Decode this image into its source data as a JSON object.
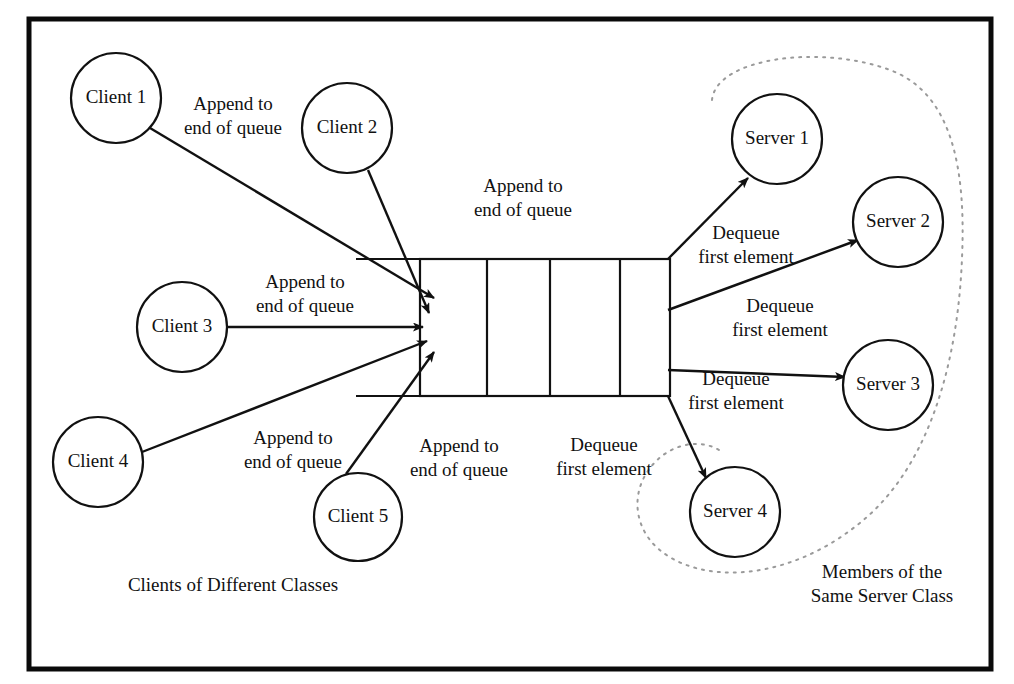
{
  "figure": {
    "background_color": "#ffffff",
    "ink_color": "#111111",
    "enclosure_color": "#9a9a9a",
    "frame_color": "#0a0a0a"
  },
  "clients": [
    {
      "label": "Client 1",
      "cx": 116,
      "cy": 98,
      "r": 45
    },
    {
      "label": "Client 2",
      "cx": 347,
      "cy": 128,
      "r": 45
    },
    {
      "label": "Client 3",
      "cx": 182,
      "cy": 327,
      "r": 45
    },
    {
      "label": "Client 4",
      "cx": 98,
      "cy": 462,
      "r": 45
    },
    {
      "label": "Client 5",
      "cx": 358,
      "cy": 517,
      "r": 44
    }
  ],
  "servers": [
    {
      "label": "Server 1",
      "cx": 777,
      "cy": 139,
      "r": 45
    },
    {
      "label": "Server 2",
      "cx": 898,
      "cy": 222,
      "r": 45
    },
    {
      "label": "Server 3",
      "cx": 888,
      "cy": 385,
      "r": 45
    },
    {
      "label": "Server 4",
      "cx": 735,
      "cy": 512,
      "r": 45
    }
  ],
  "queue": {
    "x": 420,
    "y": 259,
    "width": 250,
    "height": 137,
    "cells": 4,
    "divider_x": [
      487,
      550,
      620
    ],
    "rail_left_x": 356,
    "rail_top_y": 259,
    "rail_bottom_y": 396
  },
  "append_labels": [
    {
      "line1": "Append to",
      "line2": "end of queue",
      "x": 233,
      "y": 110
    },
    {
      "line1": "Append to",
      "line2": "end of queue",
      "x": 523,
      "y": 192
    },
    {
      "line1": "Append to",
      "line2": "end of queue",
      "x": 305,
      "y": 288
    },
    {
      "line1": "Append to",
      "line2": "end of queue",
      "x": 293,
      "y": 444
    },
    {
      "line1": "Append to",
      "line2": "end of queue",
      "x": 459,
      "y": 452
    }
  ],
  "dequeue_labels": [
    {
      "line1": "Dequeue",
      "line2": "first element",
      "x": 746,
      "y": 239
    },
    {
      "line1": "Dequeue",
      "line2": "first element",
      "x": 780,
      "y": 312
    },
    {
      "line1": "Dequeue",
      "line2": "first element",
      "x": 736,
      "y": 385
    },
    {
      "line1": "Dequeue",
      "line2": "first element",
      "x": 604,
      "y": 451
    }
  ],
  "group_labels": {
    "clients": {
      "text": "Clients of Different Classes",
      "x": 233,
      "y": 591
    },
    "servers": {
      "line1": "Members of the",
      "line2": "Same Server Class",
      "x": 882,
      "y": 578
    }
  },
  "append_edges": [
    {
      "from": "Client 1",
      "x1": 150,
      "y1": 128,
      "x2": 434,
      "y2": 298
    },
    {
      "from": "Client 2",
      "x1": 368,
      "y1": 170,
      "x2": 429,
      "y2": 313
    },
    {
      "from": "Client 3",
      "x1": 228,
      "y1": 327,
      "x2": 420,
      "y2": 327
    },
    {
      "from": "Client 4",
      "x1": 142,
      "y1": 452,
      "x2": 424,
      "y2": 341
    },
    {
      "from": "Client 5",
      "x1": 346,
      "y1": 474,
      "x2": 432,
      "y2": 353
    }
  ],
  "dequeue_edges": [
    {
      "to": "Server 1",
      "x1": 670,
      "y1": 259,
      "x2": 748,
      "y2": 178
    },
    {
      "to": "Server 2",
      "x1": 670,
      "y1": 310,
      "x2": 858,
      "y2": 240
    },
    {
      "to": "Server 3",
      "x1": 670,
      "y1": 370,
      "x2": 845,
      "y2": 377
    },
    {
      "to": "Server 4",
      "x1": 670,
      "y1": 396,
      "x2": 706,
      "y2": 478
    }
  ]
}
